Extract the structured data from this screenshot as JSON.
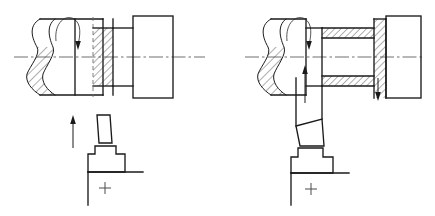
{
  "figure": {
    "type": "engineering-line-drawing",
    "background_color": "#ffffff",
    "line_color": "#1a1a1a",
    "centerline_color": "#555555",
    "hidden_line_color": "#6a6a6a",
    "panel_count": 2
  },
  "panels": [
    {
      "id": "left-panel",
      "name": "left-machining-diagram",
      "description": "Workpiece with perpendicular parting tool fed upward",
      "components": [
        {
          "name": "workpiece-shaft",
          "type": "cylindrical-body",
          "has_break_line": true,
          "break_line_style": "s-curve",
          "hatched": true
        },
        {
          "name": "rotation-arrow",
          "type": "curved-arrow",
          "direction": "clockwise-rotation",
          "label": ""
        },
        {
          "name": "cutting-groove-section",
          "type": "hatched-section",
          "hatched": true,
          "hidden_edge": true
        },
        {
          "name": "chuck-block",
          "type": "rectangle",
          "hatched": false
        },
        {
          "name": "centerline-axis",
          "type": "center-axis",
          "style": "dash-dot"
        },
        {
          "name": "feed-arrow",
          "type": "straight-arrow",
          "direction": "up"
        },
        {
          "name": "tool-holder",
          "type": "stepped-tool",
          "orientation": "vertical"
        },
        {
          "name": "tool-base-plate",
          "type": "base-line"
        },
        {
          "name": "origin-cross-mark",
          "type": "cross",
          "symbol": "+"
        }
      ]
    },
    {
      "id": "right-panel",
      "name": "right-machining-diagram",
      "description": "Workpiece with angled tool, internal bore section and downward feed",
      "components": [
        {
          "name": "workpiece-shaft",
          "type": "cylindrical-body",
          "has_break_line": true,
          "break_line_style": "s-curve",
          "hatched": true
        },
        {
          "name": "rotation-arrow",
          "type": "curved-arrow",
          "direction": "clockwise-rotation",
          "label": ""
        },
        {
          "name": "bore-wall-upper",
          "type": "hatched-band",
          "hatched": true,
          "orientation": "horizontal"
        },
        {
          "name": "bore-wall-lower",
          "type": "hatched-band",
          "hatched": true,
          "orientation": "horizontal"
        },
        {
          "name": "end-wall-section",
          "type": "hatched-band",
          "hatched": true,
          "orientation": "vertical"
        },
        {
          "name": "chuck-block",
          "type": "rectangle",
          "hatched": false
        },
        {
          "name": "centerline-axis",
          "type": "center-axis",
          "style": "dash-dot"
        },
        {
          "name": "feed-arrow-up",
          "type": "straight-arrow",
          "direction": "up"
        },
        {
          "name": "feed-arrow-down",
          "type": "straight-arrow",
          "direction": "down"
        },
        {
          "name": "tool-holder",
          "type": "stepped-tool",
          "orientation": "angled"
        },
        {
          "name": "tool-base-plate",
          "type": "base-line"
        },
        {
          "name": "origin-cross-mark",
          "type": "cross",
          "symbol": "+"
        }
      ]
    }
  ],
  "annotations": {
    "left_cross_symbol": "+",
    "right_cross_symbol": "+"
  }
}
